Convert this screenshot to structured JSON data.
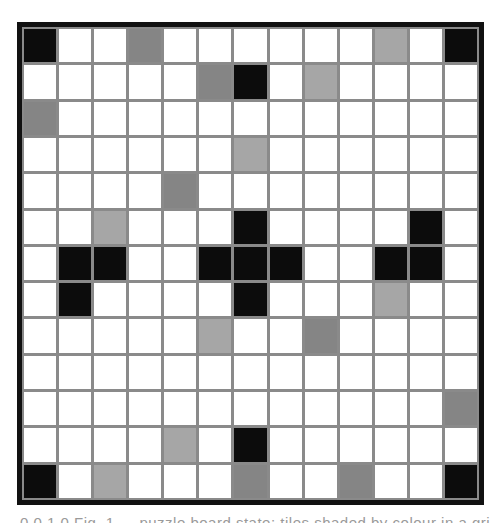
{
  "board": {
    "size": 13,
    "legend": {
      "W": {
        "label": "empty",
        "color": "#ffffff"
      },
      "K": {
        "label": "black",
        "color": "#0c0c0c"
      },
      "D": {
        "label": "dark-gray",
        "color": "#858585"
      },
      "L": {
        "label": "light-gray",
        "color": "#a6a6a6"
      }
    },
    "border_color": "#111111",
    "gridline_color": "#8a8a8a",
    "rows": [
      [
        "K",
        "W",
        "W",
        "D",
        "W",
        "W",
        "W",
        "W",
        "W",
        "W",
        "L",
        "W",
        "K"
      ],
      [
        "W",
        "W",
        "W",
        "W",
        "W",
        "D",
        "K",
        "W",
        "L",
        "W",
        "W",
        "W",
        "W"
      ],
      [
        "D",
        "W",
        "W",
        "W",
        "W",
        "W",
        "W",
        "W",
        "W",
        "W",
        "W",
        "W",
        "W"
      ],
      [
        "W",
        "W",
        "W",
        "W",
        "W",
        "W",
        "L",
        "W",
        "W",
        "W",
        "W",
        "W",
        "W"
      ],
      [
        "W",
        "W",
        "W",
        "W",
        "D",
        "W",
        "W",
        "W",
        "W",
        "W",
        "W",
        "W",
        "W"
      ],
      [
        "W",
        "W",
        "L",
        "W",
        "W",
        "W",
        "K",
        "W",
        "W",
        "W",
        "W",
        "K",
        "W"
      ],
      [
        "W",
        "K",
        "K",
        "W",
        "W",
        "K",
        "K",
        "K",
        "W",
        "W",
        "K",
        "K",
        "W"
      ],
      [
        "W",
        "K",
        "W",
        "W",
        "W",
        "W",
        "K",
        "W",
        "W",
        "W",
        "L",
        "W",
        "W"
      ],
      [
        "W",
        "W",
        "W",
        "W",
        "W",
        "L",
        "W",
        "W",
        "D",
        "W",
        "W",
        "W",
        "W"
      ],
      [
        "W",
        "W",
        "W",
        "W",
        "W",
        "W",
        "W",
        "W",
        "W",
        "W",
        "W",
        "W",
        "W"
      ],
      [
        "W",
        "W",
        "W",
        "W",
        "W",
        "W",
        "W",
        "W",
        "W",
        "W",
        "W",
        "W",
        "D"
      ],
      [
        "W",
        "W",
        "W",
        "W",
        "L",
        "W",
        "K",
        "W",
        "W",
        "W",
        "W",
        "W",
        "W"
      ],
      [
        "K",
        "W",
        "L",
        "W",
        "W",
        "W",
        "D",
        "W",
        "W",
        "D",
        "W",
        "W",
        "K"
      ]
    ]
  },
  "caption": {
    "text": "0 0 1 0   Fig. 1 — puzzle board state: tiles shaded by colour in a grid"
  }
}
